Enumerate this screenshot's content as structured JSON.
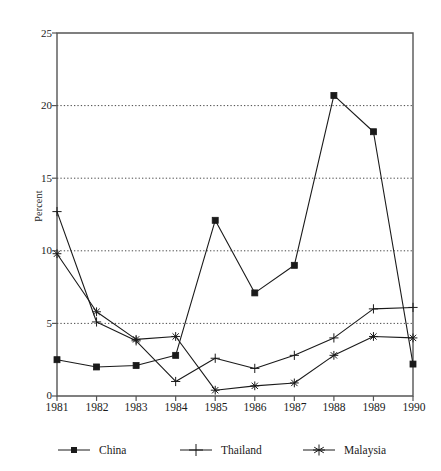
{
  "chart_data": {
    "type": "line",
    "title": "",
    "xlabel": "",
    "ylabel": "Percent",
    "categories": [
      "1981",
      "1982",
      "1983",
      "1984",
      "1985",
      "1986",
      "1987",
      "1988",
      "1989",
      "1990"
    ],
    "x": [
      1981,
      1982,
      1983,
      1984,
      1985,
      1986,
      1987,
      1988,
      1989,
      1990
    ],
    "ylim": [
      0,
      25
    ],
    "yticks": [
      0,
      5,
      10,
      15,
      20,
      25
    ],
    "ytick_labels": [
      "0",
      "5",
      "10",
      "15",
      "20",
      "25"
    ],
    "grid": "horizontal-dotted at 5, 10, 15, 20",
    "legend_position": "below-axis",
    "series": [
      {
        "name": "China",
        "marker": "filled-square",
        "values": [
          2.5,
          2.0,
          2.1,
          2.8,
          12.1,
          7.1,
          9.0,
          20.7,
          18.2,
          2.2
        ]
      },
      {
        "name": "Thailand",
        "marker": "plus",
        "values": [
          12.7,
          5.1,
          3.8,
          1.0,
          2.6,
          1.9,
          2.8,
          4.0,
          6.0,
          6.1
        ]
      },
      {
        "name": "Malaysia",
        "marker": "asterisk",
        "values": [
          9.8,
          5.8,
          3.9,
          4.1,
          0.4,
          0.7,
          0.9,
          2.8,
          4.1,
          4.0
        ]
      }
    ]
  },
  "axis": {
    "y_label": "Percent",
    "y_ticks": [
      "0",
      "5",
      "10",
      "15",
      "20",
      "25"
    ],
    "x_ticks": [
      "1981",
      "1982",
      "1983",
      "1984",
      "1985",
      "1986",
      "1987",
      "1988",
      "1989",
      "1990"
    ]
  },
  "legend": {
    "items": [
      {
        "label": "China",
        "marker": "filled-square"
      },
      {
        "label": "Thailand",
        "marker": "plus"
      },
      {
        "label": "Malaysia",
        "marker": "asterisk"
      }
    ]
  },
  "colors": {
    "line": "#1a1a1a",
    "axis": "#555555",
    "grid": "#333333",
    "background": "#ffffff"
  }
}
